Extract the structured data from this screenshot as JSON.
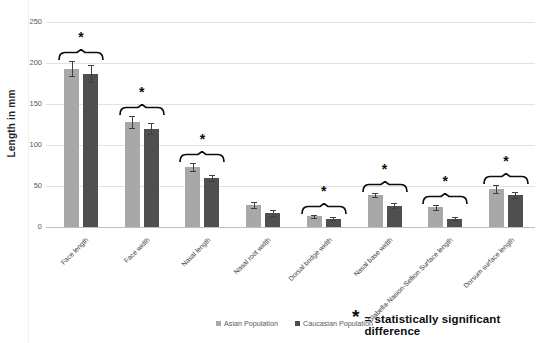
{
  "chart_data": {
    "type": "bar",
    "title": "",
    "ylabel": "Length in mm",
    "xlabel": "",
    "ylim": [
      0,
      250
    ],
    "yticks": [
      0,
      50,
      100,
      150,
      200,
      250
    ],
    "grid": true,
    "legend_position": "bottom",
    "categories": [
      "Face length",
      "Face width",
      "Nasal length",
      "Nasal root width",
      "Dorsal bridge width",
      "Nasal base width",
      "Glabella-Nasion-Sellion Surface length",
      "Dorsum surface length"
    ],
    "series": [
      {
        "name": "Asian Population",
        "color": "#a8a8a8",
        "values": [
          193,
          128,
          73,
          27,
          13,
          39,
          24,
          46
        ],
        "errors": [
          9,
          7,
          5,
          4,
          2,
          3,
          3,
          5
        ]
      },
      {
        "name": "Caucasian Population",
        "color": "#4f4f4f",
        "values": [
          187,
          120,
          60,
          17,
          10,
          26,
          10,
          39
        ],
        "errors": [
          10,
          7,
          4,
          4,
          2,
          3,
          2,
          4
        ]
      }
    ],
    "significant": [
      true,
      true,
      true,
      false,
      true,
      true,
      true,
      true
    ],
    "significance_marker": "*",
    "annotation": {
      "marker": "*",
      "text": "= statistically significant difference"
    }
  }
}
